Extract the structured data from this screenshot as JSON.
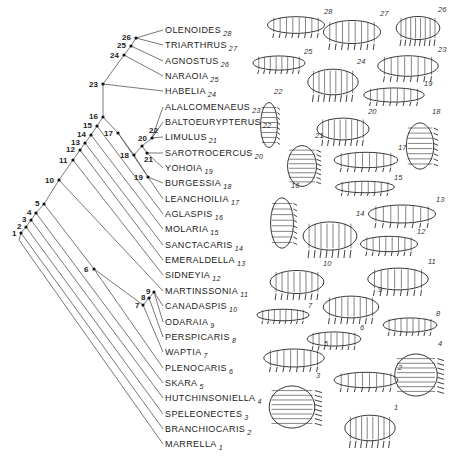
{
  "diagram": {
    "type": "cladogram",
    "line_color": "#555555",
    "root": {
      "x": 19,
      "y": 240
    },
    "label_x": 163,
    "taxa": [
      {
        "num": 28,
        "name": "OLENOIDES",
        "y": 30
      },
      {
        "num": 27,
        "name": "TRIARTHRUS",
        "y": 45
      },
      {
        "num": 26,
        "name": "AGNOSTUS",
        "y": 61
      },
      {
        "num": 25,
        "name": "NARAOIA",
        "y": 76
      },
      {
        "num": 24,
        "name": "HABELIA",
        "y": 91
      },
      {
        "num": 23,
        "name": "ALALCOMENAEUS",
        "y": 107
      },
      {
        "num": 22,
        "name": "BALTOEURYPTERUS",
        "y": 122
      },
      {
        "num": 21,
        "name": "LIMULUS",
        "y": 137
      },
      {
        "num": 20,
        "name": "SAROTROCERCUS",
        "y": 153
      },
      {
        "num": 19,
        "name": "YOHOIA",
        "y": 168
      },
      {
        "num": 18,
        "name": "BURGESSIA",
        "y": 183
      },
      {
        "num": 17,
        "name": "LEANCHOILIA",
        "y": 199
      },
      {
        "num": 16,
        "name": "AGLASPIS",
        "y": 214
      },
      {
        "num": 15,
        "name": "MOLARIA",
        "y": 229
      },
      {
        "num": 14,
        "name": "SANCTACARIS",
        "y": 245
      },
      {
        "num": 13,
        "name": "EMERALDELLA",
        "y": 260
      },
      {
        "num": 12,
        "name": "SIDNEYIA",
        "y": 275
      },
      {
        "num": 11,
        "name": "MARTINSSONIA",
        "y": 291
      },
      {
        "num": 10,
        "name": "CANADASPIS",
        "y": 306
      },
      {
        "num": 9,
        "name": "ODARAIA",
        "y": 322
      },
      {
        "num": 8,
        "name": "PERSPICARIS",
        "y": 337
      },
      {
        "num": 7,
        "name": "WAPTIA",
        "y": 352
      },
      {
        "num": 6,
        "name": "PLENOCARIS",
        "y": 368
      },
      {
        "num": 5,
        "name": "SKARA",
        "y": 383
      },
      {
        "num": 4,
        "name": "HUTCHINSONIELLA",
        "y": 398
      },
      {
        "num": 3,
        "name": "SPELEONECTES",
        "y": 414
      },
      {
        "num": 2,
        "name": "BRANCHIOCARIS",
        "y": 429
      },
      {
        "num": 1,
        "name": "MARRELLA",
        "y": 444
      }
    ],
    "nodes": [
      {
        "id": "1",
        "x": 21,
        "y": 233,
        "lx": -9,
        "ly": -3
      },
      {
        "id": "2",
        "x": 26,
        "y": 227,
        "lx": -9,
        "ly": -4
      },
      {
        "id": "3",
        "x": 31,
        "y": 220,
        "lx": -9,
        "ly": -4
      },
      {
        "id": "4",
        "x": 36,
        "y": 213,
        "lx": -9,
        "ly": -4
      },
      {
        "id": "5",
        "x": 44,
        "y": 204,
        "lx": -9,
        "ly": -4
      },
      {
        "id": "6",
        "x": 94,
        "y": 269,
        "lx": -10,
        "ly": -3
      },
      {
        "id": "7",
        "x": 143,
        "y": 305,
        "lx": -8,
        "ly": -3
      },
      {
        "id": "8",
        "x": 149,
        "y": 298,
        "lx": -8,
        "ly": -4
      },
      {
        "id": "9",
        "x": 154,
        "y": 292,
        "lx": -8,
        "ly": -4
      },
      {
        "id": "10",
        "x": 59,
        "y": 180,
        "lx": -14,
        "ly": -3
      },
      {
        "id": "11",
        "x": 73,
        "y": 160,
        "lx": -14,
        "ly": -3
      },
      {
        "id": "12",
        "x": 80,
        "y": 150,
        "lx": -14,
        "ly": -4
      },
      {
        "id": "13",
        "x": 85,
        "y": 143,
        "lx": -14,
        "ly": -4
      },
      {
        "id": "14",
        "x": 91,
        "y": 135,
        "lx": -14,
        "ly": -4
      },
      {
        "id": "15",
        "x": 97,
        "y": 126,
        "lx": -14,
        "ly": -4
      },
      {
        "id": "16",
        "x": 103,
        "y": 117,
        "lx": -14,
        "ly": -4
      },
      {
        "id": "17",
        "x": 118,
        "y": 133,
        "lx": -14,
        "ly": -3
      },
      {
        "id": "18",
        "x": 134,
        "y": 155,
        "lx": -14,
        "ly": -3
      },
      {
        "id": "19",
        "x": 148,
        "y": 177,
        "lx": -14,
        "ly": -3
      },
      {
        "id": "20",
        "x": 142,
        "y": 146,
        "lx": -4,
        "ly": -11
      },
      {
        "id": "21",
        "x": 147,
        "y": 153,
        "lx": -3,
        "ly": 3
      },
      {
        "id": "22",
        "x": 152,
        "y": 138,
        "lx": -3,
        "ly": -11
      },
      {
        "id": "23",
        "x": 103,
        "y": 84,
        "lx": -14,
        "ly": -3
      },
      {
        "id": "24",
        "x": 124,
        "y": 55,
        "lx": -14,
        "ly": -3
      },
      {
        "id": "25",
        "x": 131,
        "y": 46,
        "lx": -14,
        "ly": -4
      },
      {
        "id": "26",
        "x": 136,
        "y": 38,
        "lx": -14,
        "ly": -4
      }
    ],
    "edges": [
      [
        19,
        240,
        21,
        233
      ],
      [
        21,
        233,
        26,
        227
      ],
      [
        26,
        227,
        31,
        220
      ],
      [
        31,
        220,
        36,
        213
      ],
      [
        36,
        213,
        44,
        204
      ],
      [
        44,
        204,
        59,
        180
      ],
      [
        59,
        180,
        73,
        160
      ],
      [
        73,
        160,
        80,
        150
      ],
      [
        80,
        150,
        85,
        143
      ],
      [
        85,
        143,
        91,
        135
      ],
      [
        91,
        135,
        97,
        126
      ],
      [
        97,
        126,
        103,
        117
      ],
      [
        103,
        117,
        103,
        84
      ],
      [
        103,
        84,
        124,
        55
      ],
      [
        124,
        55,
        131,
        46
      ],
      [
        131,
        46,
        136,
        38
      ],
      [
        136,
        38,
        163,
        30
      ],
      [
        136,
        38,
        163,
        45
      ],
      [
        131,
        46,
        163,
        61
      ],
      [
        124,
        55,
        163,
        76
      ],
      [
        103,
        84,
        163,
        91
      ],
      [
        103,
        117,
        118,
        133
      ],
      [
        118,
        133,
        134,
        155
      ],
      [
        134,
        155,
        142,
        146
      ],
      [
        142,
        146,
        152,
        138
      ],
      [
        152,
        138,
        163,
        107
      ],
      [
        152,
        138,
        163,
        122
      ],
      [
        152,
        138,
        163,
        137
      ],
      [
        142,
        146,
        147,
        153
      ],
      [
        147,
        153,
        163,
        153
      ],
      [
        147,
        153,
        163,
        168
      ],
      [
        118,
        133,
        163,
        199
      ],
      [
        134,
        155,
        148,
        177
      ],
      [
        148,
        177,
        163,
        183
      ],
      [
        97,
        126,
        163,
        214
      ],
      [
        91,
        135,
        163,
        229
      ],
      [
        85,
        143,
        163,
        245
      ],
      [
        80,
        150,
        163,
        260
      ],
      [
        73,
        160,
        163,
        275
      ],
      [
        59,
        180,
        163,
        291
      ],
      [
        44,
        204,
        94,
        269
      ],
      [
        94,
        269,
        143,
        305
      ],
      [
        143,
        305,
        149,
        298
      ],
      [
        149,
        298,
        154,
        292
      ],
      [
        154,
        292,
        163,
        306
      ],
      [
        154,
        292,
        163,
        322
      ],
      [
        149,
        298,
        163,
        337
      ],
      [
        143,
        305,
        163,
        352
      ],
      [
        94,
        269,
        163,
        368
      ],
      [
        36,
        213,
        163,
        383
      ],
      [
        31,
        220,
        163,
        398
      ],
      [
        26,
        227,
        163,
        414
      ],
      [
        21,
        233,
        163,
        429
      ],
      [
        19,
        240,
        163,
        444
      ]
    ]
  },
  "figures": [
    {
      "num": "28",
      "x": 262,
      "y": 12,
      "w": 68,
      "h": 26
    },
    {
      "num": "27",
      "x": 318,
      "y": 14,
      "w": 68,
      "h": 36
    },
    {
      "num": "26",
      "x": 392,
      "y": 10,
      "w": 52,
      "h": 36
    },
    {
      "num": "25",
      "x": 248,
      "y": 52,
      "w": 62,
      "h": 22
    },
    {
      "num": "24",
      "x": 303,
      "y": 62,
      "w": 60,
      "h": 40
    },
    {
      "num": "23",
      "x": 372,
      "y": 50,
      "w": 72,
      "h": 32
    },
    {
      "num": "22",
      "x": 258,
      "y": 92,
      "w": 22,
      "h": 66
    },
    {
      "num": "19",
      "x": 358,
      "y": 84,
      "w": 72,
      "h": 22
    },
    {
      "num": "20",
      "x": 312,
      "y": 112,
      "w": 62,
      "h": 34
    },
    {
      "num": "18",
      "x": 402,
      "y": 112,
      "w": 36,
      "h": 68
    },
    {
      "num": "21",
      "x": 283,
      "y": 136,
      "w": 38,
      "h": 60
    },
    {
      "num": "17",
      "x": 328,
      "y": 148,
      "w": 76,
      "h": 24
    },
    {
      "num": "15",
      "x": 330,
      "y": 178,
      "w": 70,
      "h": 18
    },
    {
      "num": "16",
      "x": 267,
      "y": 186,
      "w": 30,
      "h": 74
    },
    {
      "num": "13",
      "x": 362,
      "y": 200,
      "w": 80,
      "h": 28
    },
    {
      "num": "14",
      "x": 298,
      "y": 214,
      "w": 64,
      "h": 44
    },
    {
      "num": "12",
      "x": 355,
      "y": 232,
      "w": 68,
      "h": 24
    },
    {
      "num": "10",
      "x": 265,
      "y": 264,
      "w": 64,
      "h": 36
    },
    {
      "num": "11",
      "x": 362,
      "y": 262,
      "w": 72,
      "h": 34
    },
    {
      "num": "9",
      "x": 318,
      "y": 290,
      "w": 66,
      "h": 34
    },
    {
      "num": "7",
      "x": 252,
      "y": 306,
      "w": 62,
      "h": 18
    },
    {
      "num": "8",
      "x": 378,
      "y": 314,
      "w": 64,
      "h": 22
    },
    {
      "num": "6",
      "x": 302,
      "y": 328,
      "w": 64,
      "h": 22
    },
    {
      "num": "5",
      "x": 258,
      "y": 344,
      "w": 72,
      "h": 28
    },
    {
      "num": "4",
      "x": 388,
      "y": 344,
      "w": 56,
      "h": 62
    },
    {
      "num": "2",
      "x": 328,
      "y": 368,
      "w": 76,
      "h": 24
    },
    {
      "num": "3",
      "x": 262,
      "y": 376,
      "w": 60,
      "h": 62
    },
    {
      "num": "1",
      "x": 340,
      "y": 408,
      "w": 60,
      "h": 40
    }
  ]
}
